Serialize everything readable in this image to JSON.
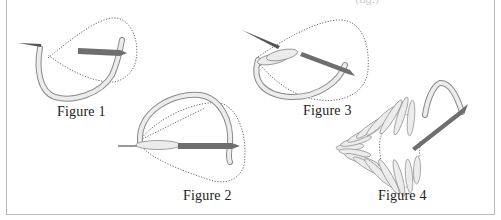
{
  "diagram": {
    "top_caption_partial": "(fig.)",
    "figures": [
      {
        "id": 1,
        "label": "Figure 1"
      },
      {
        "id": 2,
        "label": "Figure 2"
      },
      {
        "id": 3,
        "label": "Figure 3"
      },
      {
        "id": 4,
        "label": "Figure 4"
      }
    ],
    "colors": {
      "thread_fill": "#ececec",
      "thread_stroke": "#8a8a8a",
      "needle": "#6e6e6e",
      "dotted_path": "#555555",
      "frame": "#b9b9b9",
      "label": "#222222"
    }
  }
}
